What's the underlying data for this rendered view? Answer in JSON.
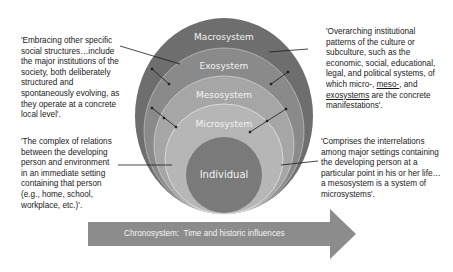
{
  "diagram": {
    "layers": [
      {
        "label": "Macrosystem",
        "color": "#6e6e6e"
      },
      {
        "label": "Exosystem",
        "color": "#8a8a8a"
      },
      {
        "label": "Mesosystem",
        "color": "#a8a8a8"
      },
      {
        "label": "Microsystem",
        "color": "#b8b8b8"
      },
      {
        "label": "Individual",
        "color": "#7a7a7a"
      }
    ],
    "chronosystem": {
      "label": "Chronosystem:",
      "text": "Time and historic influences",
      "color": "#8c8c8c"
    },
    "quotes": {
      "exosystem": "'Embracing other specific social structures…include the major institutions of the society, both deliberately structured and spontaneously evolving, as they operate at a concrete local level'.",
      "microsystem": "'The complex of relations between the developing person and environment in an immediate setting containing that person (e.g., home, school, workplace, etc.)'.",
      "macrosystem_pre": "'Overarching institutional patterns of the culture or subculture, such as the economic, social, educational, legal, and political systems, of which micro-, ",
      "macrosystem_meso": "meso-",
      "macrosystem_mid": ", and ",
      "macrosystem_exo": "exosystems",
      "macrosystem_post": " are the concrete manifestations'.",
      "mesosystem": "'Comprises the interrelations among major settings containing the developing person at a particular point in his or her life…a mesosystem is a system of microsystems'."
    }
  }
}
